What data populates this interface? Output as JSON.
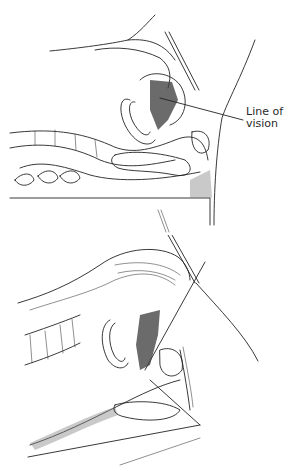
{
  "figure": {
    "panels": [
      {
        "id": "top",
        "label_line1": "Line of",
        "label_line2": "vision"
      },
      {
        "id": "bottom",
        "label_line1": "Line of",
        "label_line2": "vision"
      }
    ]
  }
}
